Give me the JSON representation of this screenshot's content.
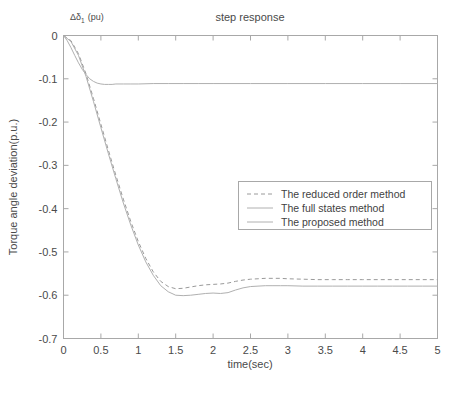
{
  "chart_data": {
    "type": "line",
    "title": "step response",
    "xlabel": "time(sec)",
    "ylabel": "Torque angle deviation(p.u.)",
    "corner_annotation": "Δδ",
    "corner_annotation_sub": "1",
    "corner_annotation_unit": "(pu)",
    "xlim": [
      0,
      5
    ],
    "ylim": [
      -0.7,
      0
    ],
    "grid": false,
    "legend_position": "center-right",
    "xticks": [
      "0",
      "0.5",
      "1",
      "1.5",
      "2",
      "2.5",
      "3",
      "3.5",
      "4",
      "4.5",
      "5"
    ],
    "xtick_values": [
      0,
      0.5,
      1,
      1.5,
      2,
      2.5,
      3,
      3.5,
      4,
      4.5,
      5
    ],
    "yticks": [
      "0",
      "-0.1",
      "-0.2",
      "-0.3",
      "-0.4",
      "-0.5",
      "-0.6",
      "-0.7"
    ],
    "ytick_values": [
      0,
      -0.1,
      -0.2,
      -0.3,
      -0.4,
      -0.5,
      -0.6,
      -0.7
    ],
    "series": [
      {
        "name": "The reduced order method",
        "style": "dashed",
        "color": "#9a9a9a",
        "x": [
          0,
          0.1,
          0.2,
          0.3,
          0.4,
          0.5,
          0.6,
          0.7,
          0.8,
          0.9,
          1.0,
          1.1,
          1.2,
          1.3,
          1.4,
          1.5,
          1.6,
          1.7,
          1.8,
          1.9,
          2.0,
          2.1,
          2.2,
          2.3,
          2.4,
          2.5,
          2.6,
          2.7,
          2.8,
          2.9,
          3.0,
          3.2,
          3.4,
          3.6,
          3.8,
          4.0,
          4.2,
          4.4,
          4.6,
          4.8,
          5.0
        ],
        "values": [
          0,
          -0.012,
          -0.042,
          -0.088,
          -0.145,
          -0.205,
          -0.265,
          -0.323,
          -0.378,
          -0.43,
          -0.476,
          -0.515,
          -0.546,
          -0.568,
          -0.58,
          -0.585,
          -0.584,
          -0.581,
          -0.578,
          -0.576,
          -0.575,
          -0.574,
          -0.572,
          -0.568,
          -0.565,
          -0.563,
          -0.562,
          -0.561,
          -0.561,
          -0.561,
          -0.562,
          -0.563,
          -0.564,
          -0.564,
          -0.564,
          -0.564,
          -0.564,
          -0.564,
          -0.564,
          -0.564,
          -0.564
        ]
      },
      {
        "name": "The full states method",
        "style": "solid",
        "color": "#b0b0b0",
        "x": [
          0,
          0.1,
          0.2,
          0.3,
          0.4,
          0.5,
          0.6,
          0.7,
          0.8,
          0.9,
          1.0,
          1.1,
          1.2,
          1.3,
          1.4,
          1.5,
          1.6,
          1.7,
          1.8,
          1.9,
          2.0,
          2.1,
          2.2,
          2.3,
          2.4,
          2.5,
          2.6,
          2.7,
          2.8,
          2.9,
          3.0,
          3.2,
          3.4,
          3.6,
          3.8,
          4.0,
          4.2,
          4.4,
          4.6,
          4.8,
          5.0
        ],
        "values": [
          0,
          -0.014,
          -0.046,
          -0.094,
          -0.152,
          -0.213,
          -0.273,
          -0.331,
          -0.387,
          -0.438,
          -0.484,
          -0.523,
          -0.554,
          -0.578,
          -0.592,
          -0.6,
          -0.601,
          -0.6,
          -0.598,
          -0.596,
          -0.595,
          -0.596,
          -0.594,
          -0.588,
          -0.583,
          -0.58,
          -0.579,
          -0.578,
          -0.578,
          -0.578,
          -0.578,
          -0.579,
          -0.579,
          -0.579,
          -0.579,
          -0.579,
          -0.579,
          -0.579,
          -0.579,
          -0.579,
          -0.579
        ]
      },
      {
        "name": "The proposed method",
        "style": "solid",
        "color": "#b0b0b0",
        "x": [
          0,
          0.05,
          0.1,
          0.15,
          0.2,
          0.25,
          0.3,
          0.35,
          0.4,
          0.45,
          0.5,
          0.55,
          0.6,
          0.65,
          0.7,
          0.8,
          0.9,
          1.0,
          1.2,
          1.4,
          1.6,
          1.8,
          2.0,
          2.5,
          3.0,
          3.5,
          4.0,
          4.5,
          5.0
        ],
        "values": [
          0,
          -0.012,
          -0.028,
          -0.046,
          -0.063,
          -0.078,
          -0.09,
          -0.1,
          -0.106,
          -0.11,
          -0.112,
          -0.113,
          -0.113,
          -0.113,
          -0.112,
          -0.112,
          -0.112,
          -0.112,
          -0.111,
          -0.111,
          -0.111,
          -0.111,
          -0.111,
          -0.111,
          -0.111,
          -0.111,
          -0.111,
          -0.111,
          -0.111
        ]
      }
    ]
  },
  "legend": {
    "entries": [
      "The reduced order method",
      "The full states method",
      "The proposed method"
    ]
  }
}
